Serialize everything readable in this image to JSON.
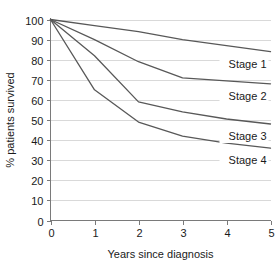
{
  "chart_data": {
    "type": "line",
    "title": "",
    "xlabel": "Years since diagnosis",
    "ylabel": "% patients survived",
    "x": [
      0,
      1,
      2,
      3,
      4,
      5
    ],
    "xlim": [
      0,
      5
    ],
    "ylim": [
      0,
      100
    ],
    "xticks": [
      "0",
      "1",
      "2",
      "3",
      "4",
      "5"
    ],
    "yticks": [
      "0",
      "10",
      "20",
      "30",
      "40",
      "50",
      "60",
      "70",
      "80",
      "90",
      "100"
    ],
    "grid": "horizontal",
    "legend_position": "inline-right",
    "line_color": "#585858",
    "grid_color": "#d9d9d9",
    "axis_color": "#7a7a7a",
    "series": [
      {
        "name": "Stage 1",
        "label": "Stage 1",
        "values": [
          100,
          97,
          94,
          90,
          87,
          84
        ]
      },
      {
        "name": "Stage 2",
        "label": "Stage 2",
        "values": [
          100,
          90,
          79,
          71,
          69.5,
          68
        ]
      },
      {
        "name": "Stage 3",
        "label": "Stage 3",
        "values": [
          100,
          82,
          59,
          54,
          50.5,
          48
        ]
      },
      {
        "name": "Stage 4",
        "label": "Stage 4",
        "values": [
          100,
          65,
          49,
          42,
          38.5,
          36
        ]
      }
    ]
  }
}
